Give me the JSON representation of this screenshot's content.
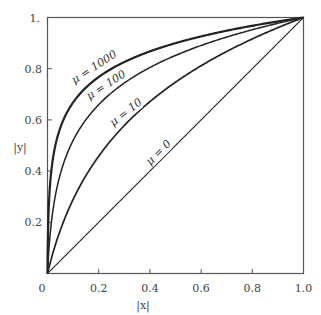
{
  "chart_data": {
    "type": "line",
    "title": "",
    "xlabel": "|x|",
    "ylabel": "|y|",
    "xlim": [
      0,
      1.0
    ],
    "ylim": [
      0,
      1.0
    ],
    "grid": false,
    "legend": "inline curve labels",
    "x_ticks": [
      "0",
      "0.2",
      "0.4",
      "0.6",
      "0.8",
      "1.0"
    ],
    "y_ticks": [
      "0.2",
      "0.4",
      "0.6",
      "0.8",
      "1."
    ],
    "formula": "|y| = ln(1 + mu|x|) / ln(1 + mu)",
    "x": [
      0,
      0.05,
      0.1,
      0.2,
      0.3,
      0.4,
      0.5,
      0.6,
      0.7,
      0.8,
      0.9,
      1.0
    ],
    "series": [
      {
        "name": "μ = 1000",
        "mu": 1000,
        "label": "μ = 1000",
        "values": [
          0,
          0.57,
          0.67,
          0.77,
          0.83,
          0.87,
          0.9,
          0.93,
          0.95,
          0.97,
          0.98,
          1.0
        ]
      },
      {
        "name": "μ = 100",
        "mu": 100,
        "label": "μ = 100",
        "values": [
          0,
          0.38,
          0.52,
          0.66,
          0.75,
          0.8,
          0.85,
          0.89,
          0.93,
          0.95,
          0.98,
          1.0
        ]
      },
      {
        "name": "μ = 10",
        "mu": 10,
        "label": "μ = 10",
        "values": [
          0,
          0.17,
          0.29,
          0.46,
          0.57,
          0.65,
          0.75,
          0.81,
          0.87,
          0.92,
          0.96,
          1.0
        ]
      },
      {
        "name": "μ = 0",
        "mu": 0,
        "label": "μ = 0",
        "values": [
          0,
          0.05,
          0.1,
          0.2,
          0.3,
          0.4,
          0.5,
          0.6,
          0.7,
          0.8,
          0.9,
          1.0
        ]
      }
    ]
  }
}
